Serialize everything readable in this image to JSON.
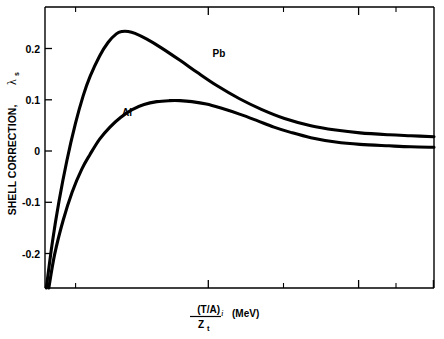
{
  "figure": {
    "background_color": "#ffffff",
    "line_color": "#000000"
  },
  "axes": {
    "y_title_main": "SHELL CORRECTION,",
    "y_title_symbol": "λ",
    "y_title_symbol_sub": "s",
    "x_title_numerator": "(T/A)",
    "x_title_numerator_sub": "i",
    "x_title_denominator": "Z",
    "x_title_denominator_sub": "t",
    "x_title_units": "(MeV)"
  },
  "series_labels": {
    "pb": "Pb",
    "al": "Al"
  },
  "chart_data": {
    "type": "line",
    "title": "",
    "xlabel": "(T/A)i / Zt  (MeV)",
    "ylabel": "SHELL CORRECTION, λs",
    "xscale": "log",
    "xlim": [
      0.025,
      10
    ],
    "ylim": [
      -0.285,
      0.3
    ],
    "grid": false,
    "legend": "inline-annotations",
    "xticks_major": [
      0.1,
      1.0,
      10
    ],
    "xticklabels_major": [
      "0.1",
      "1.0",
      "10"
    ],
    "xticks_minor": [
      0.03,
      0.04,
      0.05,
      0.06,
      0.07,
      0.08,
      0.09,
      0.2,
      0.3,
      0.4,
      0.5,
      0.6,
      0.7,
      0.8,
      0.9,
      2,
      3,
      4,
      5,
      6,
      7,
      8,
      9
    ],
    "yticks": [
      -0.2,
      -0.1,
      0,
      0.1,
      0.2
    ],
    "yticklabels": [
      "-0.2",
      "-0.1",
      "0",
      "0.1",
      "0.2"
    ],
    "series": [
      {
        "name": "Pb",
        "x": [
          0.0255,
          0.028,
          0.031,
          0.035,
          0.04,
          0.045,
          0.05,
          0.058,
          0.066,
          0.075,
          0.082,
          0.09,
          0.1,
          0.12,
          0.15,
          0.2,
          0.26,
          0.35,
          0.5,
          0.7,
          1.0,
          1.5,
          2.2,
          3.2,
          5.0,
          7.0,
          10.0
        ],
        "y": [
          -0.285,
          -0.19,
          -0.105,
          -0.02,
          0.058,
          0.115,
          0.155,
          0.198,
          0.226,
          0.244,
          0.249,
          0.249,
          0.245,
          0.233,
          0.215,
          0.189,
          0.164,
          0.137,
          0.109,
          0.087,
          0.068,
          0.053,
          0.044,
          0.038,
          0.034,
          0.032,
          0.03
        ]
      },
      {
        "name": "Al",
        "x": [
          0.0265,
          0.029,
          0.033,
          0.038,
          0.044,
          0.05,
          0.058,
          0.068,
          0.08,
          0.095,
          0.115,
          0.14,
          0.17,
          0.2,
          0.24,
          0.3,
          0.38,
          0.5,
          0.65,
          0.85,
          1.1,
          1.5,
          2.2,
          3.2,
          5.0,
          7.0,
          10.0
        ],
        "y": [
          -0.285,
          -0.215,
          -0.145,
          -0.085,
          -0.038,
          -0.007,
          0.025,
          0.05,
          0.07,
          0.086,
          0.097,
          0.103,
          0.105,
          0.105,
          0.103,
          0.098,
          0.089,
          0.077,
          0.064,
          0.05,
          0.039,
          0.028,
          0.019,
          0.014,
          0.011,
          0.009,
          0.008
        ]
      }
    ],
    "annotations": [
      {
        "text": "Pb",
        "x": 0.33,
        "y": 0.195
      },
      {
        "text": "Al",
        "x": 0.082,
        "y": 0.073
      }
    ]
  }
}
